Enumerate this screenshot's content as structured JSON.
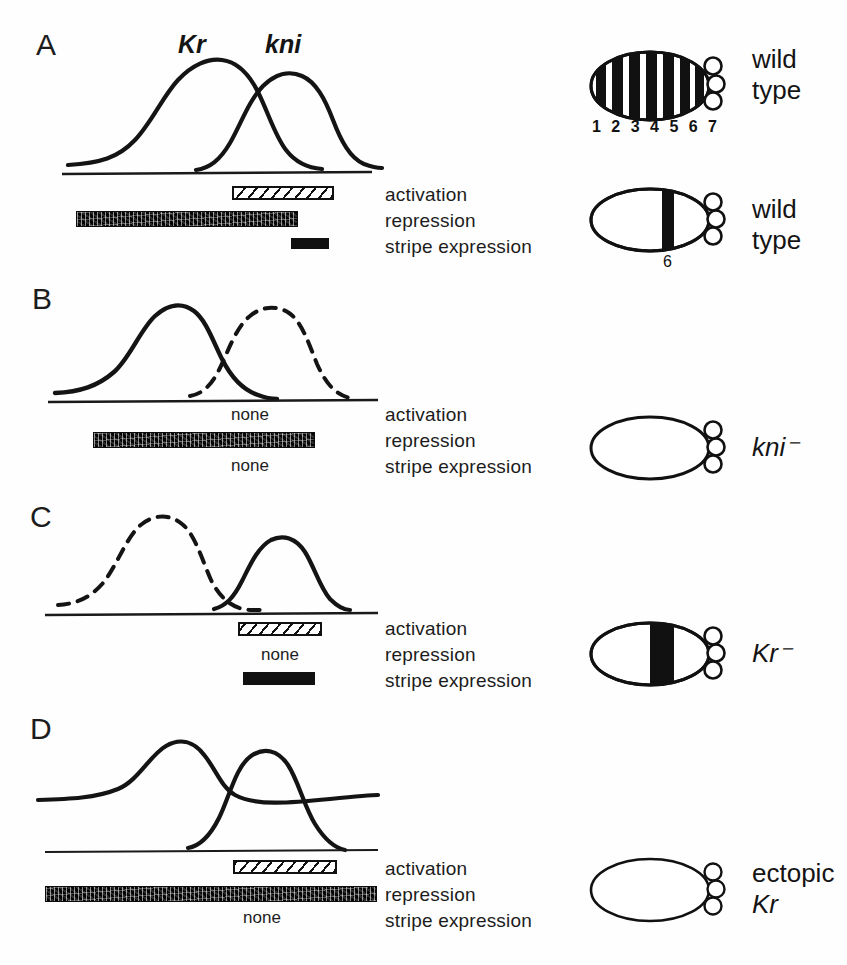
{
  "figure": {
    "row_labels": [
      "activation",
      "repression",
      "stripe expression"
    ],
    "none_text": "none",
    "gene_labels": {
      "kr": "Kr",
      "kni": "kni"
    }
  },
  "panels": [
    {
      "letter": "A",
      "curves": {
        "kr": {
          "style": "solid",
          "label": "Kr"
        },
        "kni": {
          "style": "solid",
          "label": "kni"
        }
      },
      "activation": "bar",
      "repression": "bar",
      "stripe_expression": "bar",
      "phenotype": {
        "line1": "wild",
        "line2": "type",
        "italic": false
      },
      "embryo": {
        "type": "striped",
        "stripes": 7,
        "numbers": "1 2 3 4 5 6 7"
      }
    },
    {
      "letter": "A2",
      "phenotype": {
        "line1": "wild",
        "line2": "type",
        "italic": false
      },
      "embryo": {
        "type": "single-stripe",
        "stripe_number": "6"
      }
    },
    {
      "letter": "B",
      "curves": {
        "kr": {
          "style": "solid",
          "label": "Kr"
        },
        "kni": {
          "style": "dashed",
          "label": "kni"
        }
      },
      "activation": "none",
      "repression": "bar",
      "stripe_expression": "none",
      "phenotype": {
        "line1": "kni⁻",
        "line2": "",
        "italic": true
      },
      "embryo": {
        "type": "empty"
      }
    },
    {
      "letter": "C",
      "curves": {
        "kr": {
          "style": "dashed",
          "label": "Kr"
        },
        "kni": {
          "style": "solid",
          "label": "kni"
        }
      },
      "activation": "bar",
      "repression": "none",
      "stripe_expression": "bar",
      "phenotype": {
        "line1": "Kr⁻",
        "line2": "",
        "italic": true
      },
      "embryo": {
        "type": "wide-stripe"
      }
    },
    {
      "letter": "D",
      "curves": {
        "kr": {
          "style": "solid-elevated",
          "label": "Kr"
        },
        "kni": {
          "style": "solid",
          "label": "kni"
        }
      },
      "activation": "bar",
      "repression": "bar",
      "stripe_expression": "none",
      "phenotype": {
        "line1": "ectopic",
        "line2": "Kr",
        "italic_line2": true
      },
      "embryo": {
        "type": "empty"
      }
    }
  ],
  "colors": {
    "ink": "#111111",
    "background": "#fefefe",
    "repression_fill": "#2a2a2a"
  }
}
